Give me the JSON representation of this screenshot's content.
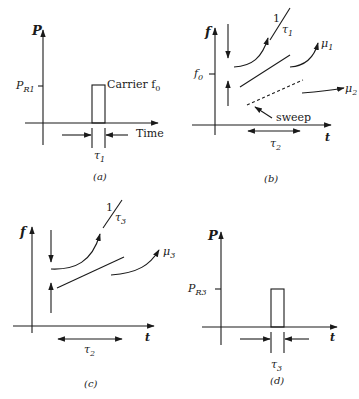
{
  "figure": {
    "panels": [
      {
        "id": "a",
        "caption": "(a)",
        "y_axis_label": "P",
        "x_axis_label": "Time",
        "level_label": "P",
        "level_label_sub": "R1",
        "pulse_label": "Carrier f",
        "pulse_label_sub": "0",
        "width_label": "τ",
        "width_label_sub": "1"
      },
      {
        "id": "b",
        "caption": "(b)",
        "y_axis_label": "f",
        "x_axis_label": "t",
        "level_label": "f",
        "level_label_sub": "0",
        "slope_label_num": "1",
        "slope_label_den": "τ",
        "slope_label_den_sub": "1",
        "mu1_label": "μ",
        "mu1_sub": "1",
        "mu2_label": "μ",
        "mu2_sub": "2",
        "sweep_label": "sweep",
        "width_label": "τ",
        "width_label_sub": "2"
      },
      {
        "id": "c",
        "caption": "(c)",
        "y_axis_label": "f",
        "x_axis_label": "t",
        "slope_label_num": "1",
        "slope_label_den": "τ",
        "slope_label_den_sub": "3",
        "mu3_label": "μ",
        "mu3_sub": "3",
        "width_label": "τ",
        "width_label_sub": "2"
      },
      {
        "id": "d",
        "caption": "(d)",
        "y_axis_label": "P",
        "x_axis_label": "t",
        "level_label": "P",
        "level_label_sub": "R3",
        "width_label": "τ",
        "width_label_sub": "3"
      }
    ]
  }
}
